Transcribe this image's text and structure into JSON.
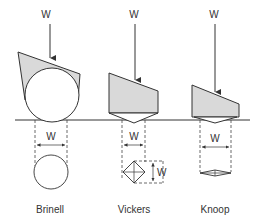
{
  "diagram": {
    "load_symbol": "W",
    "width_symbol": "W",
    "baseline": "specimen surface",
    "tests": [
      {
        "name": "Brinell",
        "load_label": "W",
        "width_label": "W",
        "indenter": "sphere",
        "impression": "circle"
      },
      {
        "name": "Vickers",
        "load_label": "W",
        "width_label": "W",
        "depth_label": "W",
        "indenter": "square pyramid",
        "impression": "square-diagonals"
      },
      {
        "name": "Knoop",
        "load_label": "W",
        "width_label": "W",
        "indenter": "elongated pyramid",
        "impression": "elongated rhombus"
      }
    ],
    "colors": {
      "ink": "#333333",
      "indenter_fill": "#d9d9d9",
      "background": "#ffffff"
    }
  }
}
